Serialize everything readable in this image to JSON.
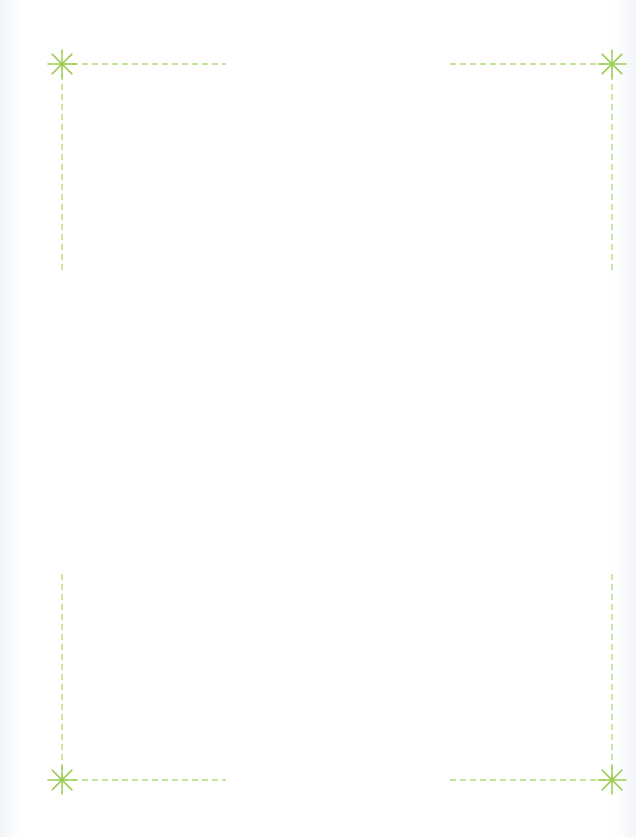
{
  "page": {
    "background": "#ffffff"
  },
  "colors": {
    "dash_line": "#b4dc78",
    "starburst": "#9ccd52"
  },
  "corner_marks": [
    {
      "name": "top-left",
      "star": [
        62,
        64
      ],
      "h_line": [
        62,
        226
      ],
      "v_line": [
        64,
        272
      ]
    },
    {
      "name": "top-right",
      "star": [
        612,
        64
      ],
      "h_line": [
        450,
        612
      ],
      "v_line": [
        64,
        272
      ]
    },
    {
      "name": "bottom-left",
      "star": [
        62,
        780
      ],
      "h_line": [
        62,
        226
      ],
      "v_line": [
        574,
        780
      ]
    },
    {
      "name": "bottom-right",
      "star": [
        612,
        780
      ],
      "h_line": [
        450,
        612
      ],
      "v_line": [
        574,
        780
      ]
    }
  ]
}
